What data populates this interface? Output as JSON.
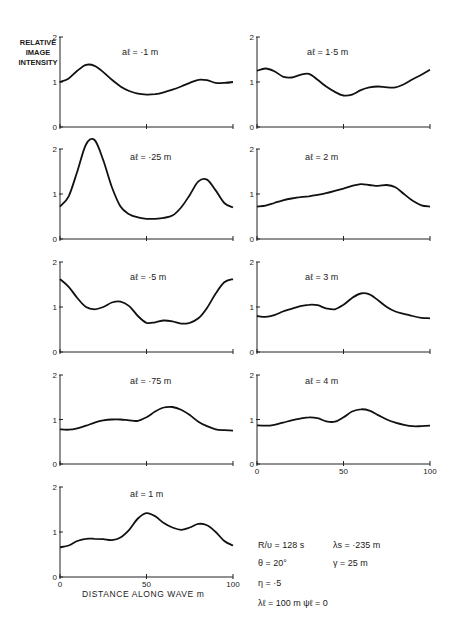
{
  "figure": {
    "ylabel_lines": [
      "RELATIVE",
      "IMAGE",
      "INTENSITY"
    ],
    "xlabel": "DISTANCE ALONG WAVE  m",
    "parameters": [
      {
        "text": "R/υ  =  128 s",
        "x": 258,
        "y": 548
      },
      {
        "text": "λs  =  ·235 m",
        "x": 333,
        "y": 548
      },
      {
        "text": "θ   =  20°",
        "x": 258,
        "y": 566
      },
      {
        "text": "γ   =   25 m",
        "x": 333,
        "y": 566
      },
      {
        "text": "η   =  ·5",
        "x": 258,
        "y": 586
      },
      {
        "text": "λℓ  =  100 m   ψℓ  =  0",
        "x": 258,
        "y": 606
      }
    ]
  },
  "chart_data": [
    {
      "type": "line",
      "title": "aℓ = ·1 m",
      "xlabel": "",
      "ylabel": "RELATIVE IMAGE INTENSITY",
      "xlim": [
        0,
        100
      ],
      "ylim": [
        0,
        2
      ],
      "xticks": [
        0,
        50,
        100
      ],
      "yticks": [
        0,
        1,
        2
      ],
      "panel": {
        "x0": 60,
        "x1": 233,
        "y0": 127,
        "y2": 37,
        "title_x": 122,
        "title_y": 55,
        "show_x_labels": false
      },
      "x": [
        0,
        5,
        10,
        15,
        20,
        25,
        30,
        35,
        40,
        45,
        50,
        55,
        60,
        65,
        70,
        75,
        80,
        85,
        90,
        95,
        100
      ],
      "values": [
        1.0,
        1.08,
        1.25,
        1.38,
        1.36,
        1.22,
        1.05,
        0.9,
        0.8,
        0.74,
        0.72,
        0.73,
        0.77,
        0.83,
        0.9,
        0.98,
        1.05,
        1.04,
        0.98,
        0.98,
        1.0
      ]
    },
    {
      "type": "line",
      "title": "aℓ = 1·5 m",
      "xlim": [
        0,
        100
      ],
      "ylim": [
        0,
        2
      ],
      "xticks": [
        0,
        50,
        100
      ],
      "yticks": [
        0,
        1,
        2
      ],
      "panel": {
        "x0": 257,
        "x1": 430,
        "y0": 127,
        "y2": 37,
        "title_x": 307,
        "title_y": 55,
        "show_x_labels": false
      },
      "x": [
        0,
        5,
        10,
        15,
        20,
        25,
        30,
        35,
        40,
        45,
        50,
        55,
        60,
        65,
        70,
        75,
        80,
        85,
        90,
        95,
        100
      ],
      "values": [
        1.25,
        1.3,
        1.24,
        1.12,
        1.1,
        1.16,
        1.18,
        1.05,
        0.9,
        0.78,
        0.7,
        0.72,
        0.82,
        0.88,
        0.9,
        0.88,
        0.88,
        0.95,
        1.06,
        1.16,
        1.27
      ]
    },
    {
      "type": "line",
      "title": "aℓ = ·25 m",
      "xlim": [
        0,
        100
      ],
      "ylim": [
        0,
        2
      ],
      "xticks": [
        0,
        50,
        100
      ],
      "yticks": [
        0,
        1,
        2
      ],
      "panel": {
        "x0": 60,
        "x1": 233,
        "y0": 239,
        "y2": 149,
        "title_x": 130,
        "title_y": 160,
        "show_x_labels": false
      },
      "x": [
        0,
        5,
        10,
        15,
        20,
        25,
        30,
        35,
        40,
        45,
        50,
        55,
        60,
        65,
        70,
        75,
        80,
        85,
        90,
        95,
        100
      ],
      "values": [
        0.72,
        0.95,
        1.5,
        2.1,
        2.2,
        1.75,
        1.15,
        0.72,
        0.55,
        0.48,
        0.45,
        0.45,
        0.47,
        0.52,
        0.7,
        0.98,
        1.28,
        1.32,
        1.08,
        0.8,
        0.7
      ]
    },
    {
      "type": "line",
      "title": "aℓ = 2 m",
      "xlim": [
        0,
        100
      ],
      "ylim": [
        0,
        2
      ],
      "xticks": [
        0,
        50,
        100
      ],
      "yticks": [
        0,
        1,
        2
      ],
      "panel": {
        "x0": 257,
        "x1": 430,
        "y0": 239,
        "y2": 149,
        "title_x": 305,
        "title_y": 160,
        "show_x_labels": false
      },
      "x": [
        0,
        5,
        10,
        15,
        20,
        25,
        30,
        35,
        40,
        45,
        50,
        55,
        60,
        65,
        70,
        75,
        80,
        85,
        90,
        95,
        100
      ],
      "values": [
        0.72,
        0.74,
        0.8,
        0.86,
        0.9,
        0.93,
        0.95,
        0.98,
        1.02,
        1.07,
        1.12,
        1.18,
        1.22,
        1.2,
        1.18,
        1.2,
        1.15,
        1.0,
        0.85,
        0.75,
        0.72
      ]
    },
    {
      "type": "line",
      "title": "aℓ = ·5 m",
      "xlim": [
        0,
        100
      ],
      "ylim": [
        0,
        2
      ],
      "xticks": [
        0,
        50,
        100
      ],
      "yticks": [
        0,
        1,
        2
      ],
      "panel": {
        "x0": 60,
        "x1": 233,
        "y0": 352,
        "y2": 262,
        "title_x": 130,
        "title_y": 280,
        "show_x_labels": false
      },
      "x": [
        0,
        5,
        10,
        15,
        20,
        25,
        30,
        35,
        40,
        45,
        50,
        55,
        60,
        65,
        70,
        75,
        80,
        85,
        90,
        95,
        100
      ],
      "values": [
        1.62,
        1.45,
        1.2,
        1.0,
        0.95,
        1.0,
        1.1,
        1.12,
        1.02,
        0.8,
        0.65,
        0.66,
        0.7,
        0.68,
        0.63,
        0.65,
        0.75,
        0.98,
        1.3,
        1.55,
        1.62
      ]
    },
    {
      "type": "line",
      "title": "aℓ = 3 m",
      "xlim": [
        0,
        100
      ],
      "ylim": [
        0,
        2
      ],
      "xticks": [
        0,
        50,
        100
      ],
      "yticks": [
        0,
        1,
        2
      ],
      "panel": {
        "x0": 257,
        "x1": 430,
        "y0": 352,
        "y2": 262,
        "title_x": 305,
        "title_y": 280,
        "show_x_labels": false
      },
      "x": [
        0,
        5,
        10,
        15,
        20,
        25,
        30,
        35,
        40,
        45,
        50,
        55,
        60,
        65,
        70,
        75,
        80,
        85,
        90,
        95,
        100
      ],
      "values": [
        0.8,
        0.78,
        0.82,
        0.9,
        0.96,
        1.02,
        1.05,
        1.04,
        0.97,
        0.95,
        1.05,
        1.2,
        1.3,
        1.28,
        1.15,
        1.0,
        0.9,
        0.85,
        0.8,
        0.76,
        0.75
      ]
    },
    {
      "type": "line",
      "title": "aℓ = ·75 m",
      "xlim": [
        0,
        100
      ],
      "ylim": [
        0,
        2
      ],
      "xticks": [
        0,
        50,
        100
      ],
      "yticks": [
        0,
        1,
        2
      ],
      "panel": {
        "x0": 60,
        "x1": 233,
        "y0": 464,
        "y2": 375,
        "title_x": 130,
        "title_y": 384,
        "show_x_labels": false
      },
      "x": [
        0,
        5,
        10,
        15,
        20,
        25,
        30,
        35,
        40,
        45,
        50,
        55,
        60,
        65,
        70,
        75,
        80,
        85,
        90,
        95,
        100
      ],
      "values": [
        0.78,
        0.77,
        0.8,
        0.86,
        0.93,
        0.98,
        1.0,
        1.0,
        0.98,
        0.97,
        1.05,
        1.18,
        1.27,
        1.28,
        1.22,
        1.1,
        0.95,
        0.85,
        0.78,
        0.76,
        0.75
      ]
    },
    {
      "type": "line",
      "title": "aℓ = 4 m",
      "xlim": [
        0,
        100
      ],
      "ylim": [
        0,
        2
      ],
      "xticks": [
        0,
        50,
        100
      ],
      "yticks": [
        0,
        1,
        2
      ],
      "panel": {
        "x0": 257,
        "x1": 430,
        "y0": 464,
        "y2": 375,
        "title_x": 305,
        "title_y": 384,
        "show_x_labels": true
      },
      "x": [
        0,
        5,
        10,
        15,
        20,
        25,
        30,
        35,
        40,
        45,
        50,
        55,
        60,
        65,
        70,
        75,
        80,
        85,
        90,
        95,
        100
      ],
      "values": [
        0.87,
        0.86,
        0.88,
        0.93,
        0.98,
        1.02,
        1.05,
        1.03,
        0.96,
        0.95,
        1.05,
        1.18,
        1.23,
        1.2,
        1.1,
        1.0,
        0.93,
        0.88,
        0.85,
        0.85,
        0.86
      ]
    },
    {
      "type": "line",
      "title": "aℓ = 1 m",
      "xlabel": "DISTANCE ALONG WAVE  m",
      "xlim": [
        0,
        100
      ],
      "ylim": [
        0,
        2
      ],
      "xticks": [
        0,
        50,
        100
      ],
      "yticks": [
        0,
        1,
        2
      ],
      "panel": {
        "x0": 60,
        "x1": 233,
        "y0": 577,
        "y2": 487,
        "title_x": 130,
        "title_y": 497,
        "show_x_labels": true
      },
      "x": [
        0,
        5,
        10,
        15,
        20,
        25,
        30,
        35,
        40,
        45,
        50,
        55,
        60,
        65,
        70,
        75,
        80,
        85,
        90,
        95,
        100
      ],
      "values": [
        0.66,
        0.7,
        0.8,
        0.85,
        0.85,
        0.84,
        0.82,
        0.88,
        1.05,
        1.3,
        1.42,
        1.35,
        1.2,
        1.1,
        1.05,
        1.1,
        1.18,
        1.15,
        1.0,
        0.8,
        0.7
      ]
    }
  ]
}
